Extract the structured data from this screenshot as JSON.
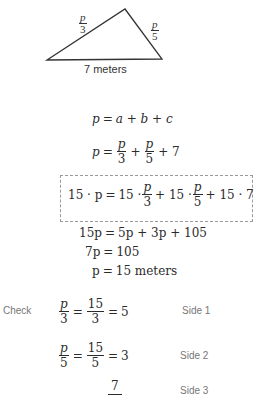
{
  "diagram": {
    "type": "triangle",
    "vertices": {
      "left": [
        47,
        60
      ],
      "top": [
        125,
        9
      ],
      "right": [
        162,
        59
      ]
    },
    "labels": {
      "side_left": {
        "num": "p",
        "den": "3"
      },
      "side_right": {
        "num": "p",
        "den": "5"
      },
      "base": "7 meters"
    }
  },
  "equations": {
    "line1": {
      "lhs": "p",
      "rhs": "a + b + c"
    },
    "line2": {
      "lhs": "p",
      "term1": {
        "num": "p",
        "den": "3"
      },
      "term2": {
        "num": "p",
        "den": "5"
      },
      "tail": "+ 7"
    },
    "boxed": {
      "lhs": "15 · p",
      "t1_coef": "15 ·",
      "t1": {
        "num": "p",
        "den": "3"
      },
      "t2_coef": "+ 15 ·",
      "t2": {
        "num": "p",
        "den": "5"
      },
      "tail": "+ 15 · 7"
    },
    "line4": {
      "lhs": "15p",
      "rhs": "5p + 3p + 105"
    },
    "line5": {
      "lhs": "7p",
      "rhs": "105"
    },
    "line6": {
      "lhs": "p",
      "rhs": "15 meters"
    }
  },
  "check": {
    "label": "Check",
    "rows": [
      {
        "a": {
          "num": "p",
          "den": "3"
        },
        "b": {
          "num": "15",
          "den": "3"
        },
        "result": "5",
        "side": "Side 1"
      },
      {
        "a": {
          "num": "p",
          "den": "5"
        },
        "b": {
          "num": "15",
          "den": "5"
        },
        "result": "3",
        "side": "Side 2"
      },
      {
        "a": {
          "num": "7",
          "den": ""
        },
        "side": "Side 3"
      }
    ]
  },
  "symbols": {
    "eq": "=",
    "plus": "+"
  }
}
